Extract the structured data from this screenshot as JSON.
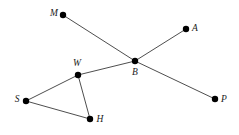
{
  "figure": {
    "type": "graph-diagram",
    "width": 239,
    "height": 135,
    "background_color": "#ffffff",
    "edge_color": "#3a3a3a",
    "edge_width": 0.9,
    "node_color": "#000000",
    "node_radius": 3.2,
    "label_color": "#1a1a1a",
    "label_style": "italic-serif"
  },
  "graph": {
    "nodes": [
      {
        "id": "M",
        "label": "M",
        "x": 63,
        "y": 15,
        "label_x": 54,
        "label_y": 14
      },
      {
        "id": "A",
        "label": "A",
        "x": 186,
        "y": 29,
        "label_x": 195,
        "label_y": 29
      },
      {
        "id": "W",
        "label": "W",
        "x": 78,
        "y": 75,
        "label_x": 77,
        "label_y": 64
      },
      {
        "id": "B",
        "label": "B",
        "x": 135,
        "y": 61,
        "label_x": 135,
        "label_y": 73
      },
      {
        "id": "S",
        "label": "S",
        "x": 26,
        "y": 101,
        "label_x": 17,
        "label_y": 100
      },
      {
        "id": "H",
        "label": "H",
        "x": 90,
        "y": 119,
        "label_x": 100,
        "label_y": 120
      },
      {
        "id": "P",
        "label": "P",
        "x": 215,
        "y": 99,
        "label_x": 224,
        "label_y": 100
      }
    ],
    "edges": [
      {
        "from": "M",
        "to": "B"
      },
      {
        "from": "A",
        "to": "B"
      },
      {
        "from": "B",
        "to": "P"
      },
      {
        "from": "B",
        "to": "W"
      },
      {
        "from": "W",
        "to": "S"
      },
      {
        "from": "W",
        "to": "H"
      },
      {
        "from": "S",
        "to": "H"
      }
    ]
  }
}
